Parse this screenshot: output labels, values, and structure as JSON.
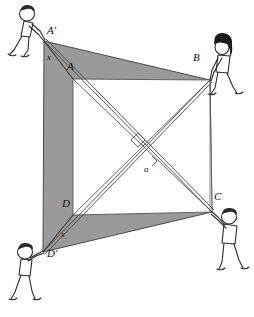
{
  "figure": {
    "type": "geometry-diagram",
    "canvas": {
      "width": 254,
      "height": 317
    },
    "colors": {
      "shaded_region": "#9a9a9a",
      "shaded_region_dark": "#8e8e8e",
      "outline": "#3b3b3b",
      "line": "#555555",
      "background": "#ffffff",
      "ink": "#111111",
      "hair_dark": "#1a1a1a"
    },
    "points": {
      "A_prime": {
        "label": "A'",
        "x": 44,
        "y": 41,
        "label_x": 47,
        "label_y": 30
      },
      "A": {
        "label": "A",
        "x": 73,
        "y": 79,
        "label_x": 67,
        "label_y": 66
      },
      "B": {
        "label": "B",
        "x": 210,
        "y": 80,
        "label_x": 194,
        "label_y": 57
      },
      "C": {
        "label": "C",
        "x": 212,
        "y": 212,
        "label_x": 214,
        "label_y": 196
      },
      "D": {
        "label": "D",
        "x": 73,
        "y": 215,
        "label_x": 63,
        "label_y": 203
      },
      "D_prime": {
        "label": "D'",
        "x": 43,
        "y": 252,
        "label_x": 46,
        "label_y": 249
      }
    },
    "segment_labels": [
      {
        "name": "x-top",
        "label": "x",
        "x": 48,
        "y": 57
      },
      {
        "name": "x-bottom",
        "label": "x",
        "x": 60,
        "y": 233
      }
    ],
    "angle_labels": [
      {
        "name": "alpha",
        "label": "a",
        "x": 145,
        "y": 167
      }
    ],
    "right_angle_marker": {
      "name": "right-angle-marker",
      "x": 138,
      "y": 140,
      "size": 9
    },
    "shaded_polygon": "A' B C D'",
    "inner_square": "A B C D",
    "diagonals": [
      "A-C",
      "B-D"
    ],
    "people": [
      {
        "name": "person-top-left",
        "pulls": "A'",
        "hair": "light"
      },
      {
        "name": "person-top-right",
        "pulls": "B",
        "hair": "dark"
      },
      {
        "name": "person-bottom-left",
        "pulls": "D'",
        "hair": "light"
      },
      {
        "name": "person-bottom-right",
        "pulls": "C",
        "hair": "light"
      }
    ]
  }
}
